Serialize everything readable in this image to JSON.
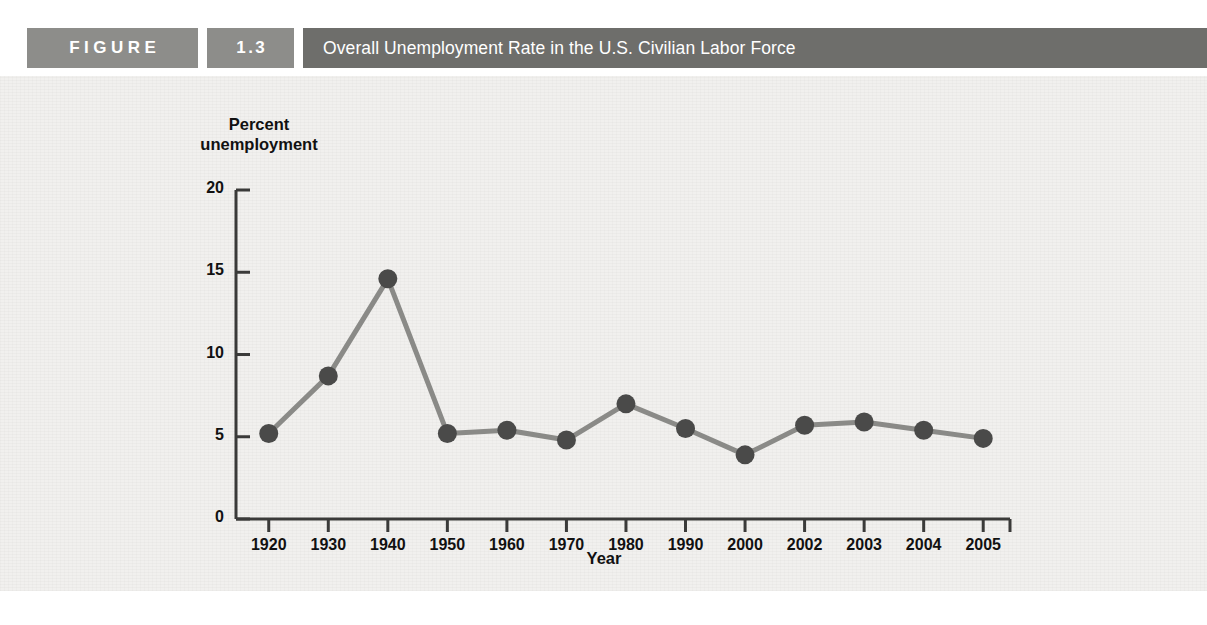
{
  "header": {
    "figure_word": "FIGURE",
    "figure_number": "1.3",
    "title": "Overall Unemployment Rate in the U.S. Civilian Labor Force",
    "box_color": "#8d8d8a",
    "title_bar_color": "#6e6e6b",
    "text_color": "#ffffff"
  },
  "chart_data": {
    "type": "line",
    "title": "Overall Unemployment Rate in the U.S. Civilian Labor Force",
    "xlabel": "Year",
    "ylabel_line1": "Percent",
    "ylabel_line2": "unemployment",
    "categories": [
      "1920",
      "1930",
      "1940",
      "1950",
      "1960",
      "1970",
      "1980",
      "1990",
      "2000",
      "2002",
      "2003",
      "2004",
      "2005"
    ],
    "values": [
      5.2,
      8.7,
      14.6,
      5.2,
      5.4,
      4.8,
      7.0,
      5.5,
      3.9,
      5.7,
      5.9,
      5.4,
      4.9
    ],
    "ylim": [
      0,
      20
    ],
    "yticks": [
      "0",
      "5",
      "10",
      "15",
      "20"
    ],
    "ytick_values": [
      0,
      5,
      10,
      15,
      20
    ],
    "grid": false,
    "legend": "none",
    "line_color": "#8a8a87",
    "marker_color": "#4a4a49",
    "axis_color": "#3a3a39",
    "plot_background": "#f1f0ee"
  }
}
